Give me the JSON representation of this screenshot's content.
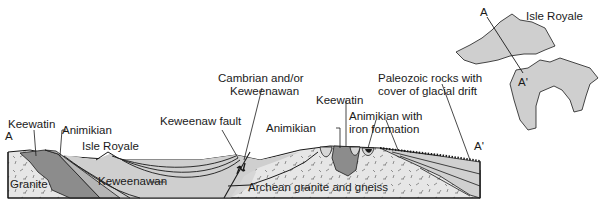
{
  "diagram": {
    "type": "geologic cross-section with location map",
    "section_endpoints": {
      "start": "A",
      "end": "A'"
    },
    "labels": {
      "keewatin_left": "Keewatin",
      "animikian_left": "Animikian",
      "isle_royale_section": "Isle Royale",
      "granite": "Granite",
      "keweenawan": "Keweenawan",
      "keweenaw_fault": "Keweenaw fault",
      "cambrian_line1": "Cambrian and/or",
      "cambrian_line2": "Keweenawan",
      "animikian_right": "Animikian",
      "keewatin_right": "Keewatin",
      "animikian_iron_line1": "Animikian with",
      "animikian_iron_line2": "iron formation",
      "paleozoic_line1": "Paleozoic rocks with",
      "paleozoic_line2": "cover of glacial drift",
      "archean": "Archean granite and gneiss",
      "point_a": "A",
      "point_a_prime": "A'"
    },
    "map": {
      "title": "Isle Royale",
      "point_a": "A",
      "point_a_prime": "A'"
    },
    "colors": {
      "dark_unit": "#8c8c8c",
      "medium_unit": "#b5b5b5",
      "light_unit": "#d6d6d6",
      "granite_fill": "#e4e4e4",
      "outline": "#1a1a1a",
      "map_fill": "#cfcfcf"
    }
  }
}
